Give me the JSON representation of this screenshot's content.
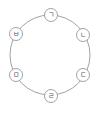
{
  "diagram": {
    "type": "cycle",
    "ring": {
      "cx": 50,
      "cy": 55,
      "r": 40,
      "color": "#8a8a8a"
    },
    "node_radius": 6.5,
    "nodes": [
      {
        "label": "ㄱ",
        "cx": 51,
        "cy": 15
      },
      {
        "label": "ㄴ",
        "cx": 83,
        "cy": 35
      },
      {
        "label": "ㄷ",
        "cx": 83,
        "cy": 75
      },
      {
        "label": "ㄹ",
        "cx": 51,
        "cy": 96
      },
      {
        "label": "ㅁ",
        "cx": 16,
        "cy": 75
      },
      {
        "label": "ㅂ",
        "cx": 16,
        "cy": 34
      }
    ]
  }
}
